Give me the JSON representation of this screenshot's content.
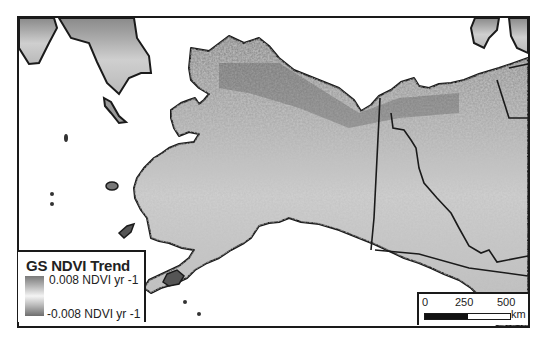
{
  "map": {
    "title": "GS NDVI Trend",
    "region": "Alaska and northwestern Canada",
    "colors": {
      "land_low": "#6e6e6e",
      "land_mid": "#bdbdbd",
      "land_high": "#f4f4f4",
      "water": "#ffffff",
      "outline": "#1a1a1a"
    }
  },
  "legend": {
    "title": "GS NDVI Trend",
    "high_label": "0.008 NDVI yr -1",
    "low_label": "-0.008 NDVI yr -1"
  },
  "scalebar": {
    "ticks": [
      "0",
      "250",
      "500"
    ],
    "unit": "km"
  }
}
